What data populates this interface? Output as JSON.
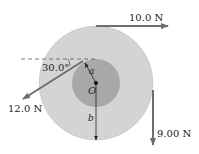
{
  "diagram": {
    "type": "rotating-cylinder-forces",
    "colors": {
      "outer_disk": "#d4d4d4",
      "inner_disk": "#a8a8a8",
      "arrow": "#6e6e6e",
      "line": "#222222"
    },
    "forces": [
      {
        "label": "10.0 N",
        "direction": "right",
        "position": "top of outer rim"
      },
      {
        "label": "12.0 N",
        "direction": "down-left at angle",
        "position": "top of inner disk"
      },
      {
        "label": "9.00 N",
        "direction": "down",
        "position": "right of outer rim"
      }
    ],
    "angle_label": "30.0°",
    "center_label": "O",
    "inner_radius_label": "a",
    "outer_radius_label": "b"
  }
}
